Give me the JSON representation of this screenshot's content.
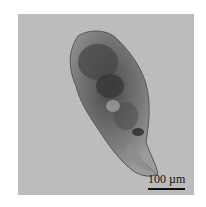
{
  "figure": {
    "background_color": "#bcbcbc",
    "scale_bar": {
      "label": "100 µm"
    }
  }
}
